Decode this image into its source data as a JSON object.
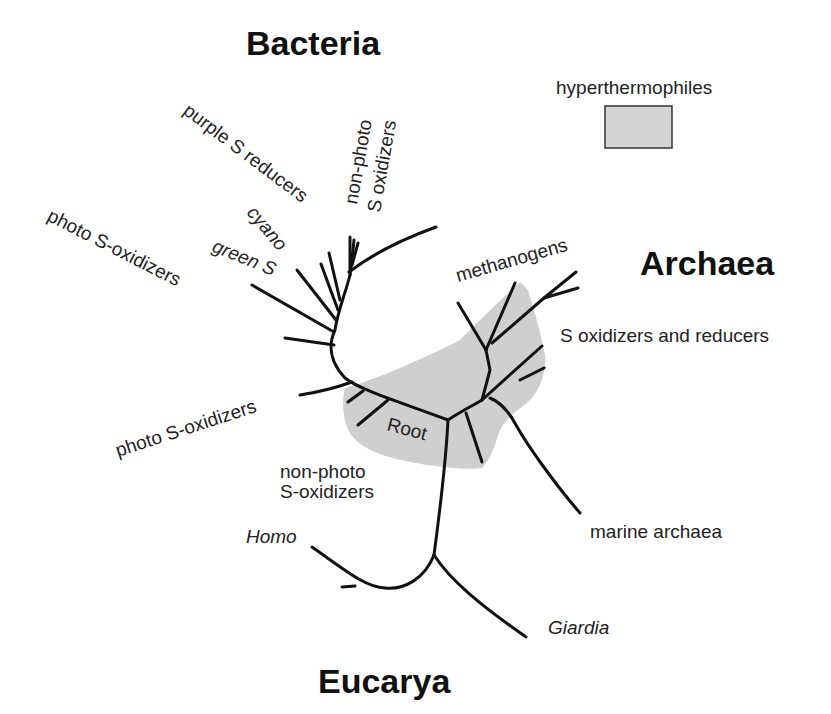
{
  "diagram": {
    "domains": {
      "bacteria": "Bacteria",
      "archaea": "Archaea",
      "eucarya": "Eucarya"
    },
    "legend": {
      "label": "hyperthermophiles",
      "swatch_color": "#d4d4d4"
    },
    "root_label": "Root",
    "bacteria_labels": {
      "purple": "purple S reducers",
      "nonphoto_line1": "non-photo",
      "nonphoto_line2": "S oxidizers",
      "cyano": "cyano",
      "green": "green S",
      "photo_top": "photo S-oxidizers",
      "photo_lower": "photo S-oxidizers",
      "nonphoto_lower_line1": "non-photo",
      "nonphoto_lower_line2": "S-oxidizers"
    },
    "archaea_labels": {
      "methanogens": "methanogens",
      "s_ox_red": "S oxidizers and reducers",
      "marine": "marine archaea"
    },
    "eucarya_labels": {
      "homo": "Homo",
      "giardia": "Giardia"
    },
    "colors": {
      "branch": "#111111",
      "hyperthermophile_region": "#cfcfcf"
    }
  }
}
